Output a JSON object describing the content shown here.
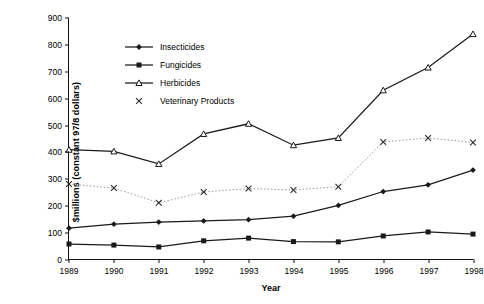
{
  "chart_data": {
    "type": "line",
    "title": "",
    "xlabel": "Year",
    "ylabel": "$millions (constant 97/8 dollars)",
    "categories": [
      "1989",
      "1990",
      "1991",
      "1992",
      "1993",
      "1994",
      "1995",
      "1996",
      "1997",
      "1998"
    ],
    "x": [
      1989,
      1990,
      1991,
      1992,
      1993,
      1994,
      1995,
      1996,
      1997,
      1998
    ],
    "ylim": [
      0,
      900
    ],
    "yticks": [
      0,
      100,
      200,
      300,
      400,
      500,
      600,
      700,
      800,
      900
    ],
    "ytick_labels": [
      "0",
      "100",
      "200",
      "300",
      "400",
      "500",
      "600",
      "700",
      "800",
      "900"
    ],
    "xlim": [
      1989,
      1998
    ],
    "grid": false,
    "legend_position": "upper left inside",
    "series": [
      {
        "name": "Insecticides",
        "marker": "diamond",
        "color": "#1a1a1a",
        "linestyle": "solid",
        "values": [
          115,
          130,
          138,
          142,
          147,
          160,
          200,
          252,
          277,
          332
        ]
      },
      {
        "name": "Fungicides",
        "marker": "square",
        "color": "#1a1a1a",
        "linestyle": "solid",
        "values": [
          56,
          52,
          45,
          68,
          78,
          65,
          64,
          86,
          101,
          93
        ]
      },
      {
        "name": "Herbicides",
        "marker": "triangle",
        "color": "#1a1a1a",
        "linestyle": "solid",
        "values": [
          408,
          402,
          355,
          467,
          505,
          425,
          452,
          630,
          715,
          840
        ]
      },
      {
        "name": "Veterinary Products",
        "marker": "cross",
        "color": "#8c8c8c",
        "linestyle": "dotted",
        "values": [
          280,
          265,
          210,
          250,
          263,
          258,
          270,
          437,
          452,
          435
        ]
      }
    ]
  },
  "legend": {
    "items": [
      {
        "label": "Insecticides",
        "marker": "diamond"
      },
      {
        "label": "Fungicides",
        "marker": "square"
      },
      {
        "label": "Herbicides",
        "marker": "triangle"
      },
      {
        "label": "Veterinary Products",
        "marker": "cross"
      }
    ]
  }
}
